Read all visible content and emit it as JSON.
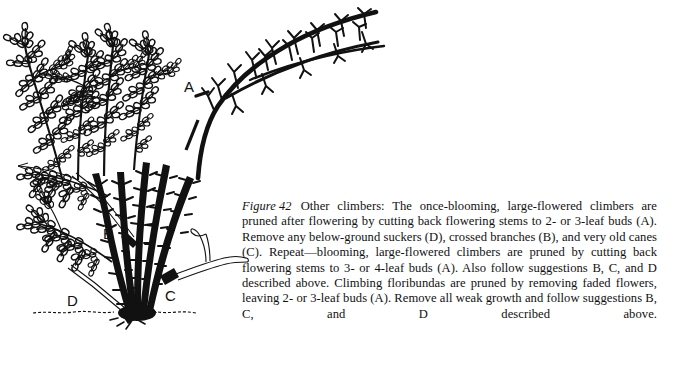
{
  "page": {
    "background_color": "#ffffff",
    "ink_color": "#111111",
    "width": 673,
    "height": 365
  },
  "illustration": {
    "name": "climbing-rose-pruning-diagram",
    "description": "Line drawing of a climbing rose bush with foliage on the left, an arching bare cane with pruned stubs extending to the upper right, thorny canes rising from a crown at soil level, and a dashed ground line.",
    "ground_line_label": "soil-line",
    "labels": [
      {
        "id": "A",
        "text": "A",
        "x": 190,
        "y": 90,
        "refers_to": "pruned flowering stems cut back to 2- or 3-leaf buds on arching cane"
      },
      {
        "id": "B",
        "text": "B",
        "x": 108,
        "y": 237,
        "refers_to": "crossed branch"
      },
      {
        "id": "C",
        "text": "C",
        "x": 170,
        "y": 300,
        "refers_to": "very old cane"
      },
      {
        "id": "D",
        "text": "D",
        "x": 72,
        "y": 305,
        "refers_to": "below-ground sucker"
      }
    ]
  },
  "caption": {
    "figure_label": "Figure 42",
    "body": "Other climbers: The once-blooming, large-flowered climbers are pruned after flowering by cutting back flowering stems to 2- or 3-leaf buds (A). Remove any below-ground suckers (D), crossed branches (B), and very old canes (C). Repeat—blooming, large-flowered climbers are pruned by cutting back flowering stems to 3- or 4-leaf buds (A). Also follow suggestions B, C, and D described above. Climbing floribundas are pruned by removing faded flowers, leaving 2- or 3-leaf buds (A). Remove all weak growth and follow suggestions B, C, and D described above."
  }
}
